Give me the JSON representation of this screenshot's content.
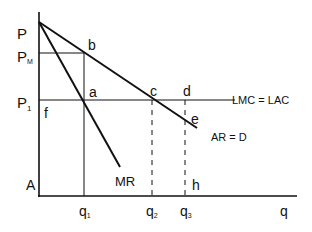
{
  "diagram": {
    "colors": {
      "ink": "#111111",
      "background": "#ffffff"
    },
    "axes": {
      "y_label_top": "P",
      "origin_label": "A",
      "x_label": "q"
    },
    "price_labels": {
      "pm": {
        "main": "P",
        "sub": "M"
      },
      "p1": {
        "main": "P",
        "sub": "1"
      }
    },
    "quantity_labels": {
      "q1": {
        "main": "q",
        "sub": "1"
      },
      "q2": {
        "main": "q",
        "sub": "2"
      },
      "q3": {
        "main": "q",
        "sub": "3"
      }
    },
    "points": {
      "a": "a",
      "b": "b",
      "c": "c",
      "d": "d",
      "e": "e",
      "f": "f",
      "h": "h"
    },
    "curves": {
      "cost": "LMC = LAC",
      "demand": "AR = D",
      "marginal_revenue": "MR"
    }
  }
}
